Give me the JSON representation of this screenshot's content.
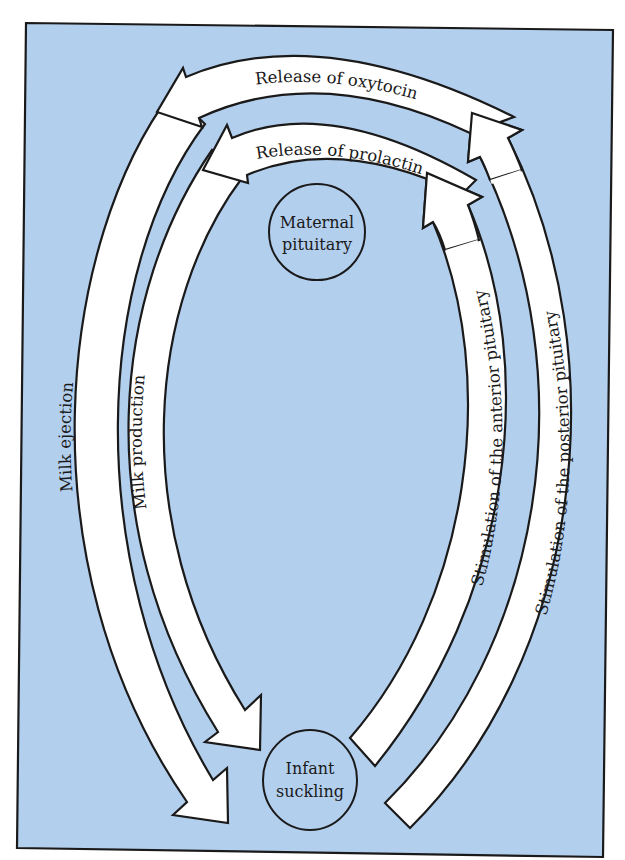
{
  "diagram": {
    "type": "feedback-cycle",
    "colors": {
      "background": "#b3cfee",
      "arrow_fill": "#ffffff",
      "outline": "#1a1a1a",
      "page": "#ffffff"
    },
    "nodes": {
      "maternal_pituitary": {
        "line1": "Maternal",
        "line2": "pituitary"
      },
      "infant_suckling": {
        "line1": "Infant",
        "line2": "suckling"
      }
    },
    "arrows": {
      "release_oxytocin": {
        "label": "Release of oxytocin",
        "from": "Stimulation of the posterior pituitary",
        "direction": "right-to-left"
      },
      "release_prolactin": {
        "label": "Release of prolactin",
        "from": "Stimulation of the anterior pituitary",
        "direction": "right-to-left"
      },
      "milk_ejection": {
        "label": "Milk ejection",
        "to": "Infant suckling",
        "direction": "downward"
      },
      "milk_production": {
        "label": "Milk production",
        "to": "Infant suckling",
        "direction": "downward"
      },
      "stim_anterior": {
        "label": "Stimulation of the anterior pituitary",
        "from": "Infant suckling",
        "direction": "upward"
      },
      "stim_posterior": {
        "label": "Stimulation of the posterior pituitary",
        "from": "Infant suckling",
        "direction": "upward"
      }
    }
  }
}
